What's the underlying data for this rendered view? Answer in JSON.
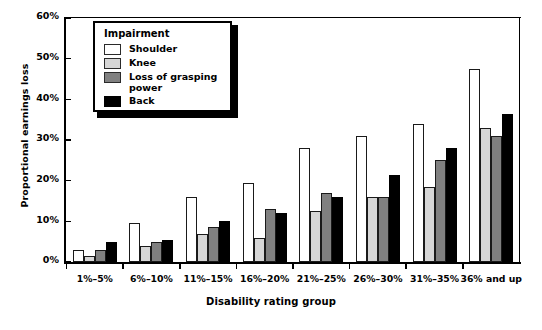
{
  "chart_data": {
    "type": "bar",
    "title": "",
    "xlabel": "Disability rating group",
    "ylabel": "Proportional earnings loss",
    "ylim": [
      0,
      60
    ],
    "yticks": [
      "0%",
      "10%",
      "20%",
      "30%",
      "40%",
      "50%",
      "60%"
    ],
    "ytick_values": [
      0,
      10,
      20,
      30,
      40,
      50,
      60
    ],
    "grid": false,
    "legend_position": "upper-left-inside",
    "legend_title": "Impairment",
    "categories": [
      "1%–5%",
      "6%–10%",
      "11%–15%",
      "16%–20%",
      "21%–25%",
      "26%–30%",
      "31%–35%",
      "36% and up"
    ],
    "series": [
      {
        "name": "Shoulder",
        "color": "#ffffff",
        "values": [
          3.0,
          9.5,
          16.0,
          19.5,
          28.0,
          31.0,
          34.0,
          47.5
        ]
      },
      {
        "name": "Knee",
        "color": "#d6d6d6",
        "values": [
          1.5,
          4.0,
          7.0,
          6.0,
          12.5,
          16.0,
          18.5,
          33.0
        ]
      },
      {
        "name": "Loss of grasping\npower",
        "color": "#808080",
        "values": [
          3.0,
          5.0,
          8.5,
          13.0,
          17.0,
          16.0,
          25.0,
          31.0
        ]
      },
      {
        "name": "Back",
        "color": "#000000",
        "values": [
          5.0,
          5.5,
          10.0,
          12.0,
          16.0,
          21.5,
          28.0,
          36.5
        ]
      }
    ]
  },
  "axis": {
    "y_title": "Proportional earnings loss",
    "x_title": "Disability rating group",
    "y_ticks": [
      "60%",
      "50%",
      "40%",
      "30%",
      "20%",
      "10%",
      "0%"
    ]
  },
  "legend": {
    "title": "Impairment",
    "entries": [
      {
        "label": "Shoulder",
        "swatch": "shoulder"
      },
      {
        "label": "Knee",
        "swatch": "knee"
      },
      {
        "label": "Loss of grasping\npower",
        "swatch": "grasp"
      },
      {
        "label": "Back",
        "swatch": "back"
      }
    ]
  }
}
